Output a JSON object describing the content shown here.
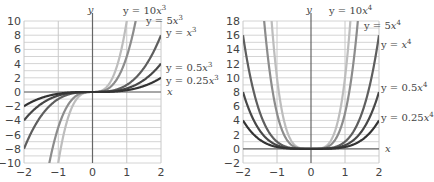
{
  "chart_data": [
    {
      "type": "line",
      "title": "",
      "xlabel": "x",
      "ylabel": "y",
      "xlim": [
        -2,
        2
      ],
      "ylim": [
        -10,
        10
      ],
      "xticks": [
        -2,
        -1,
        0,
        1,
        2
      ],
      "yticks": [
        -10,
        -8,
        -6,
        -4,
        -2,
        0,
        2,
        4,
        6,
        8,
        10
      ],
      "grid": true,
      "exponent": 3,
      "series": [
        {
          "name": "y = 10x³",
          "coef": 10,
          "color": "#bdbdbd",
          "label_pre": "y = 10",
          "label_var": "x",
          "label_exp": "3"
        },
        {
          "name": "y = 5x³",
          "coef": 5,
          "color": "#8c8c8c",
          "label_pre": "y = 5",
          "label_var": "x",
          "label_exp": "3"
        },
        {
          "name": "y = x³",
          "coef": 1,
          "color": "#5e5e5e",
          "label_pre": "y = ",
          "label_var": "x",
          "label_exp": "3"
        },
        {
          "name": "y = 0.5x³",
          "coef": 0.5,
          "color": "#474747",
          "label_pre": "y = 0.5",
          "label_var": "x",
          "label_exp": "3"
        },
        {
          "name": "y = 0.25x³",
          "coef": 0.25,
          "color": "#333333",
          "label_pre": "y = 0.25",
          "label_var": "x",
          "label_exp": "3"
        }
      ]
    },
    {
      "type": "line",
      "title": "",
      "xlabel": "x",
      "ylabel": "y",
      "xlim": [
        -2,
        2
      ],
      "ylim": [
        -2,
        18
      ],
      "xticks": [
        -2,
        -1,
        0,
        1,
        2
      ],
      "yticks": [
        -2,
        0,
        2,
        4,
        6,
        8,
        10,
        12,
        14,
        16,
        18
      ],
      "grid": true,
      "exponent": 4,
      "series": [
        {
          "name": "y = 10x⁴",
          "coef": 10,
          "color": "#bdbdbd",
          "label_pre": "y = 10",
          "label_var": "x",
          "label_exp": "4"
        },
        {
          "name": "y = 5x⁴",
          "coef": 5,
          "color": "#8c8c8c",
          "label_pre": "y = 5",
          "label_var": "x",
          "label_exp": "4"
        },
        {
          "name": "y = x⁴",
          "coef": 1,
          "color": "#5e5e5e",
          "label_pre": "y = ",
          "label_var": "x",
          "label_exp": "4"
        },
        {
          "name": "y = 0.5x⁴",
          "coef": 0.5,
          "color": "#474747",
          "label_pre": "y = 0.5",
          "label_var": "x",
          "label_exp": "4"
        },
        {
          "name": "y = 0.25x⁴",
          "coef": 0.25,
          "color": "#333333",
          "label_pre": "y = 0.25",
          "label_var": "x",
          "label_exp": "4"
        }
      ]
    }
  ],
  "layout": [
    {
      "left": 24,
      "right": 161,
      "top": 21,
      "bottom": 163,
      "labels": [
        [
          123,
          14
        ],
        [
          146,
          24
        ],
        [
          166,
          36
        ],
        [
          166,
          71
        ],
        [
          166,
          84
        ]
      ]
    },
    {
      "left": 243,
      "right": 379,
      "top": 21,
      "bottom": 163,
      "labels": [
        [
          329,
          14
        ],
        [
          364,
          29
        ],
        [
          381,
          48
        ],
        [
          381,
          91
        ],
        [
          381,
          121
        ]
      ]
    }
  ]
}
